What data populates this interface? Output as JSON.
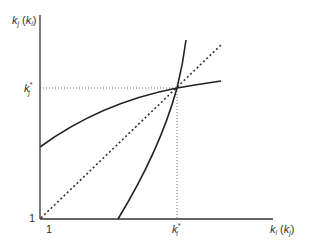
{
  "diagram": {
    "type": "reaction-curves",
    "y_axis_label": {
      "main": "k",
      "sub": "j",
      "paren_main": "k",
      "paren_sub": "i"
    },
    "x_axis_label": {
      "main": "k",
      "sub": "i",
      "paren_main": "k",
      "paren_sub": "j"
    },
    "origin_x_label": "1",
    "origin_y_label": "1",
    "equilibrium_x_label": {
      "main": "k",
      "sub": "i",
      "sup": "*"
    },
    "equilibrium_y_label": {
      "main": "k",
      "sub": "j",
      "sup": "*"
    },
    "curves": [
      {
        "name": "concave-reaction-curve",
        "style": "solid"
      },
      {
        "name": "convex-reaction-curve",
        "style": "solid"
      },
      {
        "name": "45-degree-line",
        "style": "dotted"
      }
    ],
    "guide_lines": "dotted",
    "colors": {
      "line": "#333333",
      "guide": "#666666",
      "background": "#ffffff"
    }
  }
}
